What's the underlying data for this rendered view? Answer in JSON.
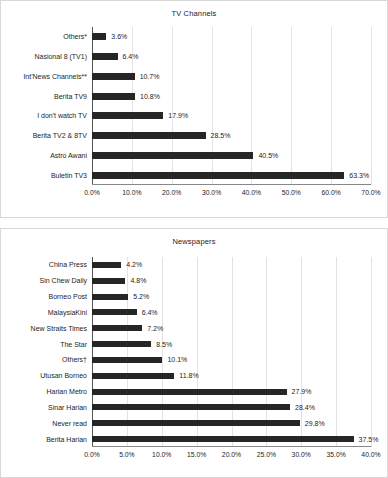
{
  "chart_data": [
    {
      "type": "bar",
      "orientation": "horizontal",
      "title": "TV Channels",
      "xlabel": "",
      "ylabel": "",
      "xlim": [
        0,
        70
      ],
      "xticks": [
        "0.0%",
        "10.0%",
        "20.0%",
        "30.0%",
        "40.0%",
        "50.0%",
        "60.0%",
        "70.0%"
      ],
      "xtick_values": [
        0,
        10,
        20,
        30,
        40,
        50,
        60,
        70
      ],
      "grid": true,
      "legend": false,
      "bar_color": "#262626",
      "categories": [
        "Others*",
        "Nasional 8 (TV1)",
        "Int'News Channels**",
        "Berita TV9",
        "I don't watch TV",
        "Berita TV2 & 8TV",
        "Astro Awani",
        "Buletin TV3"
      ],
      "values": [
        3.6,
        6.4,
        10.7,
        10.8,
        17.9,
        28.5,
        40.5,
        63.3
      ],
      "data_labels": [
        "3.6%",
        "6.4%",
        "10.7%",
        "10.8%",
        "17.9%",
        "28.5%",
        "40.5%",
        "63.3%"
      ]
    },
    {
      "type": "bar",
      "orientation": "horizontal",
      "title": "Newspapers",
      "xlabel": "",
      "ylabel": "",
      "xlim": [
        0,
        40
      ],
      "xticks": [
        "0.0%",
        "5.0%",
        "10.0%",
        "15.0%",
        "20.0%",
        "25.0%",
        "30.0%",
        "35.0%",
        "40.0%"
      ],
      "xtick_values": [
        0,
        5,
        10,
        15,
        20,
        25,
        30,
        35,
        40
      ],
      "grid": true,
      "legend": false,
      "bar_color": "#262626",
      "categories": [
        "China Press",
        "Sin Chew Daily",
        "Borneo Post",
        "MalaysiaKini",
        "New Straits Times",
        "The Star",
        "Others†",
        "Utusan Borneo",
        "Harian Metro",
        "Sinar Harian",
        "Never read",
        "Berita Harian"
      ],
      "values": [
        4.2,
        4.8,
        5.2,
        6.4,
        7.2,
        8.5,
        10.1,
        11.8,
        27.9,
        28.4,
        29.8,
        37.5
      ],
      "data_labels": [
        "4.2%",
        "4.8%",
        "5.2%",
        "6.4%",
        "7.2%",
        "8.5%",
        "10.1%",
        "11.8%",
        "27.9%",
        "28.4%",
        "29.8%",
        "37.5%"
      ]
    }
  ]
}
